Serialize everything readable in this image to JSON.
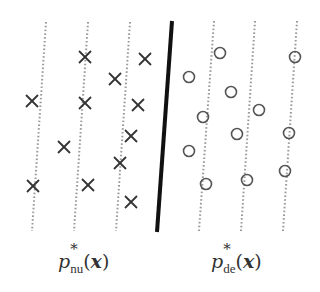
{
  "diagram": {
    "colors": {
      "background": "#ffffff",
      "marker": "#333333",
      "dotted_line": "#999999",
      "separator": "#111111"
    },
    "separator_line": {
      "x1": 172,
      "y1": 21,
      "x2": 157,
      "y2": 232,
      "width": 4
    },
    "dotted_lines": [
      {
        "x1": 46,
        "y1": 22,
        "x2": 32,
        "y2": 231
      },
      {
        "x1": 88,
        "y1": 22,
        "x2": 74,
        "y2": 231
      },
      {
        "x1": 130,
        "y1": 22,
        "x2": 116,
        "y2": 231
      },
      {
        "x1": 214,
        "y1": 21,
        "x2": 199,
        "y2": 231
      },
      {
        "x1": 255,
        "y1": 21,
        "x2": 241,
        "y2": 231
      },
      {
        "x1": 297,
        "y1": 21,
        "x2": 283,
        "y2": 231
      }
    ],
    "cross_markers": [
      {
        "x": 85,
        "y": 57
      },
      {
        "x": 145,
        "y": 59
      },
      {
        "x": 115,
        "y": 79
      },
      {
        "x": 32,
        "y": 101
      },
      {
        "x": 85,
        "y": 103
      },
      {
        "x": 138,
        "y": 105
      },
      {
        "x": 131,
        "y": 136
      },
      {
        "x": 64,
        "y": 147
      },
      {
        "x": 120,
        "y": 163
      },
      {
        "x": 33,
        "y": 186
      },
      {
        "x": 88,
        "y": 185
      },
      {
        "x": 131,
        "y": 202
      }
    ],
    "circle_markers": [
      {
        "x": 295,
        "y": 57
      },
      {
        "x": 220,
        "y": 53
      },
      {
        "x": 189,
        "y": 77
      },
      {
        "x": 231,
        "y": 92
      },
      {
        "x": 259,
        "y": 110
      },
      {
        "x": 203,
        "y": 117
      },
      {
        "x": 237,
        "y": 134
      },
      {
        "x": 289,
        "y": 133
      },
      {
        "x": 189,
        "y": 151
      },
      {
        "x": 285,
        "y": 171
      },
      {
        "x": 247,
        "y": 180
      },
      {
        "x": 206,
        "y": 184
      }
    ],
    "labels": {
      "left": {
        "base": "p",
        "sup": "*",
        "sub": "nu",
        "open": "(",
        "arg": "x",
        "close": ")"
      },
      "right": {
        "base": "p",
        "sup": "*",
        "sub": "de",
        "open": "(",
        "arg": "x",
        "close": ")"
      }
    }
  }
}
